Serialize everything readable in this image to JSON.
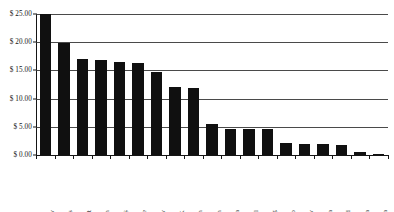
{
  "chart_data": {
    "type": "bar",
    "title": "",
    "subtitle": "",
    "xlabel": "",
    "ylabel": "",
    "ylim": [
      0,
      25
    ],
    "grid": true,
    "legend": "none",
    "orientation": "vertical",
    "bar_color": "#101010",
    "axis_color": "#151515",
    "value_prefix": "$",
    "value_format": "0.00",
    "ytick_labels": [
      "$ 25.00",
      "$ 20.00",
      "$ 15.00",
      "$ 10.00",
      "$ 5.00",
      "$ 0.00"
    ],
    "ytick_values": [
      25,
      20,
      15,
      10,
      5,
      0
    ],
    "categories": [
      "West Germany",
      "Netherlands",
      "Former DDR",
      "Japan",
      "US",
      "France",
      "Italy",
      "UK",
      "Spain",
      "Taiwan",
      "South Korea",
      "Portugal",
      "Hong Kong",
      "Mexico",
      "Hungary",
      "Malaysia",
      "Poland",
      "China",
      "Indonesia"
    ],
    "values": [
      25.0,
      19.8,
      17.1,
      16.8,
      16.5,
      16.3,
      14.7,
      12.1,
      11.8,
      5.5,
      4.6,
      4.55,
      4.7,
      2.2,
      1.9,
      1.9,
      1.7,
      0.5,
      0.25
    ]
  }
}
